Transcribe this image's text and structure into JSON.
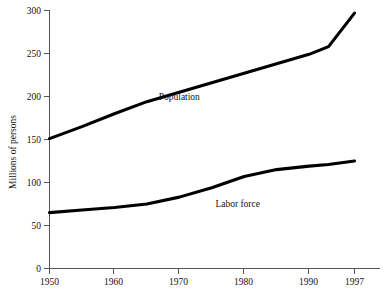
{
  "chart_data": {
    "type": "line",
    "title": "",
    "xlabel": "",
    "ylabel": "Millions of persons",
    "xlim": [
      1950,
      1997
    ],
    "ylim": [
      0,
      300
    ],
    "grid": false,
    "legend_position": "inline-annotation",
    "x_ticks": [
      "1950",
      "1960",
      "1970",
      "1980",
      "1990",
      "1997"
    ],
    "x_tick_values": [
      1950,
      1960,
      1970,
      1980,
      1990,
      1997
    ],
    "y_ticks": [
      "0",
      "50",
      "100",
      "150",
      "200",
      "250",
      "300"
    ],
    "y_tick_values": [
      0,
      50,
      100,
      150,
      200,
      250,
      300
    ],
    "x": [
      1950,
      1955,
      1960,
      1965,
      1970,
      1975,
      1980,
      1985,
      1990,
      1993,
      1997
    ],
    "series": [
      {
        "name": "Population",
        "color": "#000000",
        "values": [
          151,
          165,
          180,
          194,
          205,
          216,
          227,
          238,
          249,
          258,
          297
        ],
        "annotation": "Population"
      },
      {
        "name": "Labor force",
        "color": "#000000",
        "values": [
          65,
          68,
          71,
          75,
          83,
          94,
          107,
          115,
          119,
          121,
          125
        ],
        "annotation": "Labor force"
      }
    ],
    "annotations": [
      {
        "text": "Population",
        "x": 1970,
        "y": 196
      },
      {
        "text": "Labor force",
        "x": 1979,
        "y": 72
      }
    ]
  }
}
